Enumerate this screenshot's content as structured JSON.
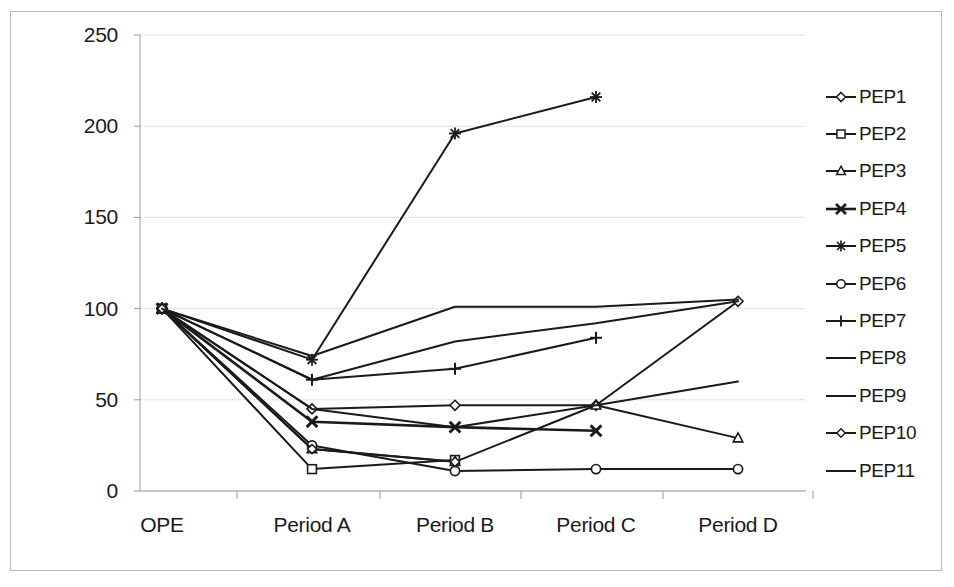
{
  "chart_data": {
    "type": "line",
    "title": "",
    "xlabel": "",
    "ylabel": "",
    "categories": [
      "OPE",
      "Period A",
      "Period B",
      "Period C",
      "Period D"
    ],
    "ylim": [
      0,
      250
    ],
    "ytick_labels": [
      "0",
      "50",
      "100",
      "150",
      "200",
      "250"
    ],
    "ytick_values": [
      0,
      50,
      100,
      150,
      200,
      250
    ],
    "grid": true,
    "legend_position": "right",
    "series": [
      {
        "name": "PEP1",
        "marker": "diamond",
        "values": [
          100,
          45,
          47,
          47,
          104
        ]
      },
      {
        "name": "PEP2",
        "marker": "square",
        "values": [
          100,
          12,
          17,
          null,
          null
        ]
      },
      {
        "name": "PEP3",
        "marker": "triangle",
        "values": [
          100,
          23,
          16,
          47,
          29
        ]
      },
      {
        "name": "PEP4",
        "marker": "x-bold",
        "values": [
          100,
          38,
          35,
          33,
          null
        ]
      },
      {
        "name": "PEP5",
        "marker": "asterisk",
        "values": [
          100,
          72,
          196,
          216,
          null
        ]
      },
      {
        "name": "PEP6",
        "marker": "circle",
        "values": [
          100,
          25,
          11,
          12,
          12
        ]
      },
      {
        "name": "PEP7",
        "marker": "plus",
        "values": [
          100,
          61,
          67,
          84,
          null
        ]
      },
      {
        "name": "PEP8",
        "marker": "none",
        "values": [
          100,
          74,
          101,
          101,
          105
        ]
      },
      {
        "name": "PEP9",
        "marker": "none",
        "values": [
          100,
          45,
          35,
          47,
          60
        ]
      },
      {
        "name": "PEP10",
        "marker": "diamond-open",
        "values": [
          100,
          23,
          16,
          null,
          null
        ]
      },
      {
        "name": "PEP11",
        "marker": "none",
        "values": [
          100,
          61,
          82,
          92,
          104
        ]
      }
    ]
  },
  "axis": {
    "y_labels": [
      "250",
      "200",
      "150",
      "100",
      "50",
      "0"
    ],
    "x_labels": [
      "OPE",
      "Period A",
      "Period B",
      "Period C",
      "Period D"
    ]
  },
  "legend": {
    "entries": [
      {
        "label": "PEP1",
        "marker": "diamond"
      },
      {
        "label": "PEP2",
        "marker": "square"
      },
      {
        "label": "PEP3",
        "marker": "triangle"
      },
      {
        "label": "PEP4",
        "marker": "x-bold"
      },
      {
        "label": "PEP5",
        "marker": "asterisk"
      },
      {
        "label": "PEP6",
        "marker": "circle"
      },
      {
        "label": "PEP7",
        "marker": "plus"
      },
      {
        "label": "PEP8",
        "marker": "none"
      },
      {
        "label": "PEP9",
        "marker": "none"
      },
      {
        "label": "PEP10",
        "marker": "diamond-open"
      },
      {
        "label": "PEP11",
        "marker": "none"
      }
    ]
  },
  "colors": {
    "line": "#1a1a1a",
    "grid": "#c9c9c9",
    "axis": "#9a9a9a",
    "frame": "#b9b9b9",
    "text": "#1a1a1a",
    "background": "#ffffff"
  },
  "geometry": {
    "plot_left": 140,
    "plot_right": 806,
    "plot_top": 35,
    "plot_bottom": 491,
    "x_positions": [
      162,
      312,
      455,
      596,
      738
    ],
    "y_label_x": 118,
    "x_label_y": 513
  }
}
